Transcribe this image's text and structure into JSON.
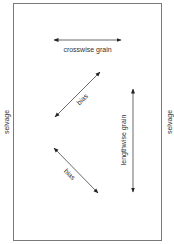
{
  "diagram": {
    "colors": {
      "border": "#7a7a7a",
      "arrow": "#333333",
      "text": "#333333",
      "background": "#ffffff"
    },
    "labels": {
      "selvage_left": "selvage",
      "selvage_right": "selvage",
      "crosswise": "crosswise grain",
      "lengthwise": "lengthwise grain",
      "bias_upper": "bias",
      "bias_lower": "bias"
    },
    "arrows": [
      {
        "name": "crosswise-grain",
        "type": "double-headed",
        "orientation": "horizontal"
      },
      {
        "name": "bias-upper",
        "type": "double-headed",
        "orientation": "diagonal-up-right"
      },
      {
        "name": "bias-lower",
        "type": "double-headed",
        "orientation": "diagonal-down-right"
      },
      {
        "name": "lengthwise-grain",
        "type": "double-headed",
        "orientation": "vertical"
      }
    ]
  }
}
